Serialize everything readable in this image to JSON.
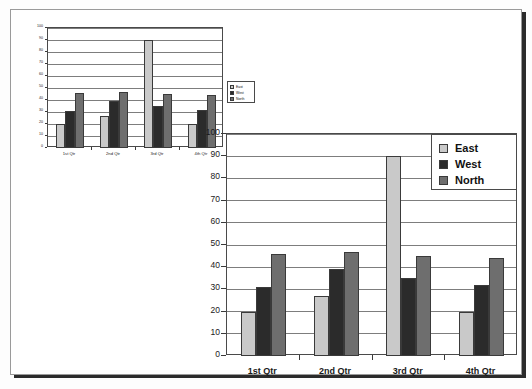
{
  "chart_data": [
    {
      "id": "small-chart",
      "type": "bar",
      "title": "",
      "xlabel": "",
      "ylabel": "",
      "categories": [
        "1st Qtr",
        "2nd Qtr",
        "3rd Qtr",
        "4th Qtr"
      ],
      "series": [
        {
          "name": "East",
          "color": "#c9c9c9",
          "values": [
            20,
            27,
            90,
            20
          ]
        },
        {
          "name": "West",
          "color": "#2b2b2b",
          "values": [
            31,
            39,
            35,
            32
          ]
        },
        {
          "name": "North",
          "color": "#6e6e6e",
          "values": [
            46,
            47,
            45,
            44
          ]
        }
      ],
      "ylim": [
        0,
        100
      ],
      "yticks": [
        0,
        10,
        20,
        30,
        40,
        50,
        60,
        70,
        80,
        90,
        100
      ],
      "ytick_labels": [
        "0",
        "10",
        "20",
        "30",
        "40",
        "50",
        "60",
        "70",
        "80",
        "90",
        "100"
      ],
      "grid": true,
      "legend_position": "right"
    },
    {
      "id": "large-chart",
      "type": "bar",
      "title": "",
      "xlabel": "",
      "ylabel": "",
      "categories": [
        "1st Qtr",
        "2nd Qtr",
        "3rd Qtr",
        "4th Qtr"
      ],
      "series": [
        {
          "name": "East",
          "color": "#c9c9c9",
          "values": [
            20,
            27,
            90,
            20
          ]
        },
        {
          "name": "West",
          "color": "#2b2b2b",
          "values": [
            31,
            39,
            35,
            32
          ]
        },
        {
          "name": "North",
          "color": "#6e6e6e",
          "values": [
            46,
            47,
            45,
            44
          ]
        }
      ],
      "ylim": [
        0,
        100
      ],
      "yticks": [
        0,
        10,
        20,
        30,
        40,
        50,
        60,
        70,
        80,
        90,
        100
      ],
      "ytick_labels": [
        "0",
        "10",
        "20",
        "30",
        "40",
        "50",
        "60",
        "70",
        "80",
        "90",
        "100"
      ],
      "grid": true,
      "legend_position": "top-right"
    }
  ],
  "colors": {
    "east": "#c9c9c9",
    "west": "#2b2b2b",
    "north": "#6e6e6e",
    "page_background": "#ffffff",
    "canvas_background": "#fdfdfd",
    "gridline": "#7d7d7d",
    "axis": "#4a4a4a"
  }
}
